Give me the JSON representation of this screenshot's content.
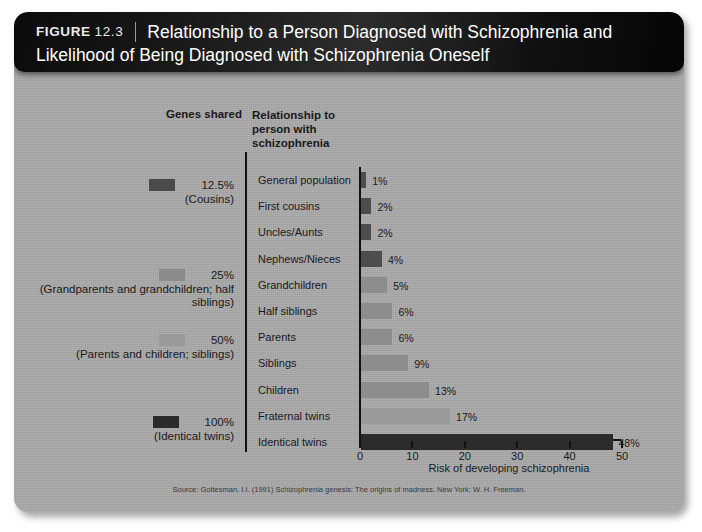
{
  "header": {
    "figure_label": "FIGURE",
    "figure_number": "12.3",
    "title": "Relationship to a Person Diagnosed with Schizophrenia and Likelihood of Being Diagnosed with Schizophrenia Oneself"
  },
  "columns": {
    "genes_shared_header": "Genes shared",
    "relationship_header": "Relationship to person with schizophrenia"
  },
  "legend": [
    {
      "percent": "12.5%",
      "group": "(Cousins)",
      "color": "#4a4a4a"
    },
    {
      "percent": "25%",
      "group": "(Grandparents and grandchildren; half siblings)",
      "color": "#8b8b8b"
    },
    {
      "percent": "50%",
      "group": "(Parents and children; siblings)",
      "color": "#9a9a9a"
    },
    {
      "percent": "100%",
      "group": "(Identical twins)",
      "color": "#2a2a2a"
    }
  ],
  "source": "Source: Gottesman, I.I. (1991) Schizophrenia genesis: The origins of madness. New York: W. H. Freeman.",
  "chart_data": {
    "type": "bar",
    "orientation": "horizontal",
    "title": "Relationship to a Person Diagnosed with Schizophrenia and Likelihood of Being Diagnosed with Schizophrenia Oneself",
    "xlabel": "Risk of developing schizophrenia",
    "ylabel": "",
    "xlim": [
      0,
      50
    ],
    "xticks": [
      0,
      10,
      20,
      30,
      40,
      50
    ],
    "grid": false,
    "legend_position": "left",
    "categories": [
      "General population",
      "First cousins",
      "Uncles/Aunts",
      "Nephews/Nieces",
      "Grandchildren",
      "Half siblings",
      "Parents",
      "Siblings",
      "Children",
      "Fraternal twins",
      "Identical twins"
    ],
    "values": [
      1,
      2,
      2,
      4,
      5,
      6,
      6,
      9,
      13,
      17,
      48
    ],
    "value_labels": [
      "1%",
      "2%",
      "2%",
      "4%",
      "5%",
      "6%",
      "6%",
      "9%",
      "13%",
      "17%",
      "48%"
    ],
    "bar_colors": [
      "#4d4d4d",
      "#4d4d4d",
      "#4d4d4d",
      "#4d4d4d",
      "#8d8d8d",
      "#8d8d8d",
      "#8d8d8d",
      "#8d8d8d",
      "#8d8d8d",
      "#9b9b9b",
      "#2b2b2b"
    ]
  }
}
